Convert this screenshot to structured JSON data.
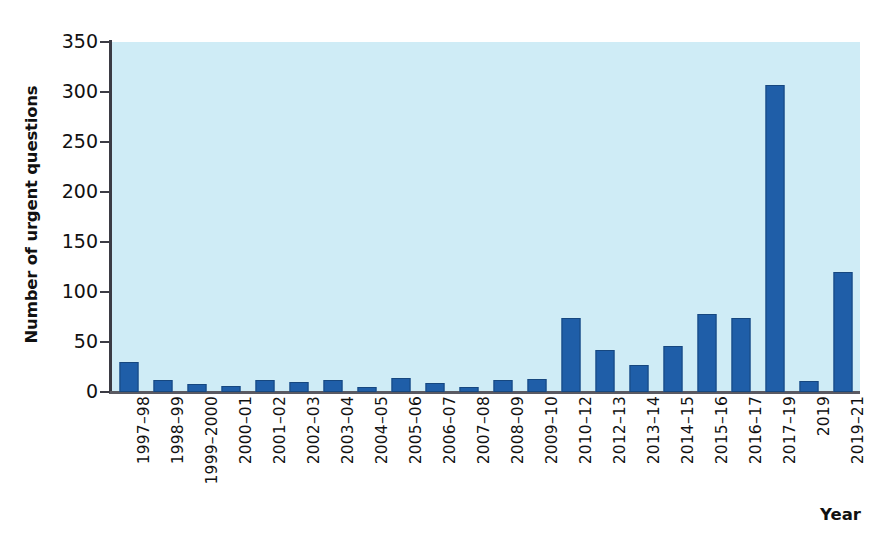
{
  "chart_data": {
    "type": "bar",
    "title": "",
    "xlabel": "Year",
    "ylabel": "Number of urgent questions",
    "ylim": [
      0,
      350
    ],
    "yticks": [
      0,
      50,
      100,
      150,
      200,
      250,
      300,
      350
    ],
    "grid": false,
    "legend": null,
    "bar_color": "#1f5ea8",
    "plot_background": "#cfecf6",
    "categories": [
      "1997–98",
      "1998–99",
      "1999–2000",
      "2000–01",
      "2001–02",
      "2002–03",
      "2003–04",
      "2004–05",
      "2005–06",
      "2006–07",
      "2007–08",
      "2008–09",
      "2009–10",
      "2010–12",
      "2012–13",
      "2013–14",
      "2014–15",
      "2015–16",
      "2016–17",
      "2017–19",
      "2019",
      "2019–21"
    ],
    "values": [
      30,
      12,
      8,
      6,
      12,
      10,
      12,
      5,
      14,
      9,
      5,
      12,
      13,
      74,
      42,
      27,
      46,
      78,
      74,
      307,
      11,
      120
    ]
  }
}
